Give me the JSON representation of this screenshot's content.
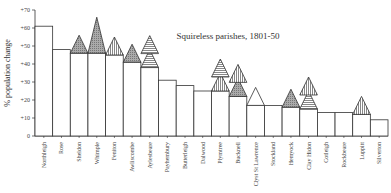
{
  "chart_data": {
    "type": "bar",
    "title": "Squireless parishes, 1801-50",
    "xlabel": "",
    "ylabel": "% population change",
    "ylim": [
      0,
      70
    ],
    "yticks": [
      "0",
      "+10",
      "+20",
      "+30",
      "+40",
      "+50",
      "+60",
      "+70"
    ],
    "grid": false,
    "categories": [
      "Northleigh",
      "Rose",
      "Sheldon",
      "Whimple",
      "Feniton",
      "Awliscombe",
      "Aylesbeare",
      "Payhembury",
      "Butterleigh",
      "Dalwood",
      "Plymtree",
      "Bucknell",
      "Clyst St Lawrence",
      "Stockland",
      "Hemyock",
      "Clay Hidon",
      "Cotleigh",
      "Rockbeare",
      "Luppitt",
      "Silverton"
    ],
    "values": [
      61,
      48,
      46,
      46,
      45,
      41,
      38,
      31,
      28,
      25,
      25,
      22,
      17,
      17,
      16,
      15,
      13,
      13,
      12,
      9
    ],
    "markers": [
      {
        "category": "Sheldon",
        "triangles": [
          "dotted"
        ]
      },
      {
        "category": "Whimple",
        "triangles": [
          "dotted-large"
        ]
      },
      {
        "category": "Feniton",
        "triangles": [
          "vertical"
        ]
      },
      {
        "category": "Awliscombe",
        "triangles": [
          "dotted"
        ]
      },
      {
        "category": "Aylesbeare",
        "triangles": [
          "horizontal",
          "horizontal"
        ]
      },
      {
        "category": "Plymtree",
        "triangles": [
          "vertical",
          "horizontal"
        ]
      },
      {
        "category": "Bucknell",
        "triangles": [
          "dotted",
          "vertical"
        ]
      },
      {
        "category": "Clyst St Lawrence",
        "triangles": [
          "plain"
        ]
      },
      {
        "category": "Hemyock",
        "triangles": [
          "dotted"
        ]
      },
      {
        "category": "Clay Hidon",
        "triangles": [
          "horizontal",
          "vertical"
        ]
      },
      {
        "category": "Luppitt",
        "triangles": [
          "vertical"
        ]
      }
    ]
  }
}
